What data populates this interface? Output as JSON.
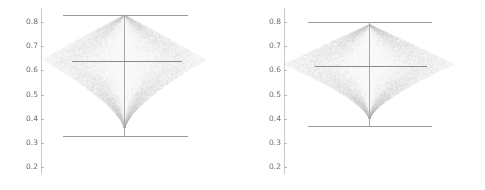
{
  "figure": {
    "type": "violin-boxplot-pair",
    "background_color": "#ffffff",
    "violin_fill_color": "#ebebeb",
    "line_color": "#9a9a9a",
    "tick_label_color": "#6e6e6e"
  },
  "chart_data": {
    "type": "box",
    "title": "",
    "xlabel": "",
    "ylabel": "",
    "ylim": [
      0.15,
      0.87
    ],
    "grid": false,
    "legend": null,
    "yticks": [
      0.8,
      0.7,
      0.6,
      0.5,
      0.4,
      0.3,
      0.2
    ],
    "ytick_labels": [
      "0.8",
      "0.7",
      "0.6",
      "0.5",
      "0.4",
      "0.3",
      "0.2"
    ],
    "panels": [
      {
        "name": "left-panel",
        "median": 0.638,
        "whisker_low": 0.327,
        "whisker_high": 0.835,
        "density_peak": 0.645,
        "violin_top": 0.83,
        "violin_bottom": 0.36
      },
      {
        "name": "right-panel",
        "median": 0.618,
        "whisker_low": 0.378,
        "whisker_high": 0.787,
        "density_peak": 0.625,
        "violin_top": 0.79,
        "violin_bottom": 0.4
      }
    ]
  },
  "panels": [
    {
      "id": "left",
      "ticks": [
        {
          "label": "0.8",
          "value": 0.8
        },
        {
          "label": "0.7",
          "value": 0.7
        },
        {
          "label": "0.6",
          "value": 0.6
        },
        {
          "label": "0.5",
          "value": 0.5
        },
        {
          "label": "0.4",
          "value": 0.4
        },
        {
          "label": "0.3",
          "value": 0.3
        },
        {
          "label": "0.2",
          "value": 0.2
        }
      ]
    },
    {
      "id": "right",
      "ticks": [
        {
          "label": "0.8",
          "value": 0.8
        },
        {
          "label": "0.7",
          "value": 0.7
        },
        {
          "label": "0.6",
          "value": 0.6
        },
        {
          "label": "0.5",
          "value": 0.5
        },
        {
          "label": "0.4",
          "value": 0.4
        },
        {
          "label": "0.3",
          "value": 0.3
        },
        {
          "label": "0.2",
          "value": 0.2
        }
      ]
    }
  ]
}
